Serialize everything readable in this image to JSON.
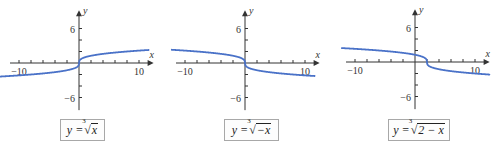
{
  "chart_data": [
    {
      "type": "line",
      "title": "y = ∛x",
      "caption": "y = ∛x",
      "caption_parts": {
        "lhs": "y = ",
        "index": "3",
        "radicand": "x"
      },
      "xlabel": "x",
      "ylabel": "y",
      "xlim": [
        -10,
        10
      ],
      "ylim": [
        -6,
        6
      ],
      "x_tick_labels": [
        "-10",
        "10"
      ],
      "y_tick_labels": [
        "6",
        "-6"
      ],
      "x_ticks_step": 2,
      "y_ticks_step": 2,
      "grid": false,
      "series_source": "computed from the caption equation; not read off the image",
      "series": [
        {
          "name": "y = ∛x",
          "color": "#4a72c8",
          "x": [
            -11,
            -8,
            -5,
            -2,
            -1,
            -0.5,
            -0.1,
            0,
            0.1,
            0.5,
            1,
            2,
            5,
            8,
            11
          ],
          "y": [
            -2.22,
            -2.0,
            -1.71,
            -1.26,
            -1.0,
            -0.79,
            -0.46,
            0,
            0.46,
            0.79,
            1.0,
            1.26,
            1.71,
            2.0,
            2.22
          ]
        }
      ]
    },
    {
      "type": "line",
      "title": "y = ∛(−x)",
      "caption": "y = ∛(−x)",
      "caption_parts": {
        "lhs": "y = ",
        "index": "3",
        "radicand": "−x"
      },
      "xlabel": "x",
      "ylabel": "y",
      "xlim": [
        -10,
        10
      ],
      "ylim": [
        -6,
        6
      ],
      "x_tick_labels": [
        "-10",
        "10"
      ],
      "y_tick_labels": [
        "6",
        "-6"
      ],
      "x_ticks_step": 2,
      "y_ticks_step": 2,
      "grid": false,
      "series_source": "computed from the caption equation; not read off the image",
      "series": [
        {
          "name": "y = ∛(−x)",
          "color": "#4a72c8",
          "x": [
            -11,
            -8,
            -5,
            -2,
            -1,
            -0.5,
            -0.1,
            0,
            0.1,
            0.5,
            1,
            2,
            5,
            8,
            11
          ],
          "y": [
            2.22,
            2.0,
            1.71,
            1.26,
            1.0,
            0.79,
            0.46,
            0,
            -0.46,
            -0.79,
            -1.0,
            -1.26,
            -1.71,
            -2.0,
            -2.22
          ]
        }
      ]
    },
    {
      "type": "line",
      "title": "y = ∛(2 − x)",
      "caption": "y = ∛(2 − x)",
      "caption_parts": {
        "lhs": "y = ",
        "index": "3",
        "radicand": "2 − x"
      },
      "xlabel": "x",
      "ylabel": "y",
      "xlim": [
        -10,
        10
      ],
      "ylim": [
        -6,
        6
      ],
      "x_tick_labels": [
        "-10",
        "10"
      ],
      "y_tick_labels": [
        "6",
        "-6"
      ],
      "x_ticks_step": 2,
      "y_ticks_step": 2,
      "grid": false,
      "series_source": "computed from the caption equation; not read off the image",
      "series": [
        {
          "name": "y = ∛(2 − x)",
          "color": "#4a72c8",
          "x": [
            -11,
            -8,
            -5,
            -2,
            0,
            1,
            1.5,
            1.9,
            2,
            2.1,
            2.5,
            3,
            4,
            7,
            10,
            12
          ],
          "y": [
            2.35,
            2.15,
            1.91,
            1.59,
            1.26,
            1.0,
            0.79,
            0.46,
            0,
            -0.46,
            -0.79,
            -1.0,
            -1.26,
            -1.71,
            -2.0,
            -2.15
          ]
        }
      ]
    }
  ],
  "panels": [
    {
      "caption_lhs": "y = ",
      "caption_index": "3",
      "caption_radicand": "x",
      "x_label": "x",
      "y_label": "y",
      "tick_x_neg": "−10",
      "tick_x_pos": "10",
      "tick_y_pos": "6",
      "tick_y_neg": "−6"
    },
    {
      "caption_lhs": "y = ",
      "caption_index": "3",
      "caption_radicand": "−x",
      "x_label": "x",
      "y_label": "y",
      "tick_x_neg": "−10",
      "tick_x_pos": "10",
      "tick_y_pos": "6",
      "tick_y_neg": "−6"
    },
    {
      "caption_lhs": "y = ",
      "caption_index": "3",
      "caption_radicand": "2 − x",
      "x_label": "x",
      "y_label": "y",
      "tick_x_neg": "−10",
      "tick_x_pos": "10",
      "tick_y_pos": "6",
      "tick_y_neg": "−6"
    }
  ],
  "colors": {
    "curve": "#4a72c8",
    "axis": "#333333",
    "caption_border": "#a8a8a8"
  }
}
